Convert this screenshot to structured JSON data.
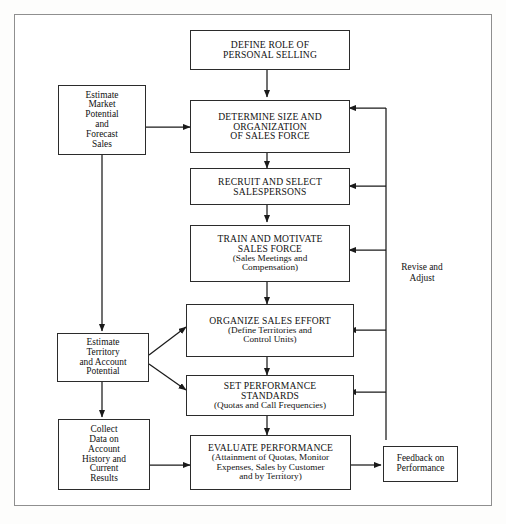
{
  "diagram": {
    "frame_color": "#8f8f8f",
    "box_border_color": "#2b2b2b",
    "line_color": "#1a1a1a",
    "background": "#ffffff"
  },
  "boxes": {
    "define_role": {
      "lines": [
        "DEFINE ROLE OF",
        "PERSONAL SELLING"
      ]
    },
    "determine_size": {
      "lines": [
        "DETERMINE SIZE AND",
        "ORGANIZATION",
        "OF SALES FORCE"
      ]
    },
    "recruit": {
      "lines": [
        "RECRUIT AND SELECT",
        "SALESPERSONS"
      ]
    },
    "train": {
      "lines": [
        "TRAIN AND MOTIVATE",
        "SALES FORCE"
      ],
      "sublines": [
        "(Sales Meetings and",
        "Compensation)"
      ]
    },
    "organize_effort": {
      "lines": [
        "ORGANIZE SALES EFFORT"
      ],
      "sublines": [
        "(Define Territories and",
        "Control Units)"
      ]
    },
    "set_standards": {
      "lines": [
        "SET PERFORMANCE",
        "STANDARDS"
      ],
      "sublines": [
        "(Quotas and Call Frequencies)"
      ]
    },
    "evaluate": {
      "lines": [
        "EVALUATE PERFORMANCE"
      ],
      "sublines": [
        "(Attainment of Quotas, Monitor",
        "Expenses, Sales by Customer",
        "and by Territory)"
      ]
    },
    "estimate_market": {
      "lines": [
        "Estimate",
        "Market",
        "Potential",
        "and",
        "Forecast",
        "Sales"
      ]
    },
    "estimate_territory": {
      "lines": [
        "Estimate",
        "Territory",
        "and Account",
        "Potential"
      ]
    },
    "collect_data": {
      "lines": [
        "Collect",
        "Data on",
        "Account",
        "History and",
        "Current",
        "Results"
      ]
    },
    "feedback": {
      "lines": [
        "Feedback on",
        "Performance"
      ]
    }
  },
  "labels": {
    "revise_adjust": {
      "lines": [
        "Revise",
        "and",
        "Adjust"
      ]
    }
  }
}
